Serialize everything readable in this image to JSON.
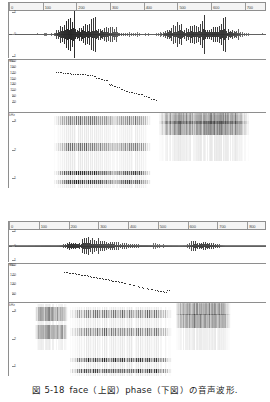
{
  "figure": {
    "caption_number": "図 5-18",
    "caption_text": "face（上図）phase（下図）の音声波形.",
    "caption_full": "図 5-18　face（上図）phase（下図）の音声波形.",
    "word_top": "face",
    "word_bottom": "phase"
  },
  "panels": [
    {
      "id": "top-panel",
      "word": "face",
      "position_label": "上図",
      "time_axis": {
        "unit": "ms",
        "ticks": [
          "0",
          "100",
          "200",
          "300",
          "400",
          "500",
          "600",
          "700"
        ],
        "min": 0,
        "max": 760
      },
      "waveform": {
        "ylabel": "",
        "ytick_labels": [
          "1",
          "0",
          "-1"
        ],
        "zero_line": true
      },
      "pitch": {
        "ylabel": "Hz",
        "unit_label": "Hz",
        "ytick_labels": [
          "200",
          "190",
          "170",
          "150",
          "130",
          "110",
          "90",
          "70"
        ],
        "ymin": 60,
        "ymax": 200
      },
      "spectrogram": {
        "ylabel": "kHz",
        "unit_label": "kHz",
        "ytick_labels": [
          "3",
          "2",
          "1"
        ],
        "ymin": 0,
        "ymax": 4
      }
    },
    {
      "id": "bottom-panel",
      "word": "phase",
      "position_label": "下図",
      "time_axis": {
        "unit": "ms",
        "ticks": [
          "0",
          "100",
          "200",
          "300",
          "400",
          "500",
          "600",
          "700",
          "800"
        ],
        "min": 0,
        "max": 860
      },
      "waveform": {
        "ylabel": "",
        "ytick_labels": [
          "1",
          "0",
          "-1"
        ],
        "zero_line": true
      },
      "pitch": {
        "ylabel": "Hz",
        "unit_label": "Hz",
        "ytick_labels": [
          "200",
          "170",
          "130",
          "90"
        ],
        "ymin": 60,
        "ymax": 200
      },
      "spectrogram": {
        "ylabel": "kHz",
        "unit_label": "kHz",
        "ytick_labels": [
          "3",
          "2",
          "1"
        ],
        "ymin": 0,
        "ymax": 4
      }
    }
  ],
  "chart_data": {
    "type": "line",
    "xlabel": "time (ms)",
    "ylabel": "amplitude / F0 (Hz) / frequency (kHz)",
    "grid": false,
    "legend": "none",
    "subcharts": [
      {
        "name": "face-waveform",
        "type": "line",
        "xlim": [
          0,
          760
        ],
        "ylim": [
          -1,
          1
        ],
        "x_ticks": [
          0,
          100,
          200,
          300,
          400,
          500,
          600,
          700
        ],
        "y_ticks": [
          -1,
          0,
          1
        ],
        "envelope_x": [
          60,
          80,
          100,
          120,
          130,
          140,
          150,
          160,
          170,
          180,
          190,
          200,
          210,
          220,
          230,
          240,
          250,
          260,
          270,
          280,
          290,
          300,
          310,
          320,
          330,
          340,
          350,
          360,
          370,
          380,
          390,
          400,
          410,
          420,
          430,
          440,
          450,
          460,
          470,
          480,
          490,
          500,
          510,
          520,
          530,
          540,
          550,
          560,
          570,
          580,
          590,
          600,
          610,
          620,
          630,
          640,
          650,
          660,
          670,
          680,
          690,
          700,
          710
        ],
        "envelope_y": [
          0.02,
          0.03,
          0.04,
          0.06,
          0.1,
          0.55,
          0.72,
          0.8,
          0.85,
          0.88,
          0.84,
          0.8,
          0.82,
          0.78,
          0.8,
          0.76,
          0.72,
          0.7,
          0.66,
          0.6,
          0.55,
          0.48,
          0.4,
          0.33,
          0.26,
          0.2,
          0.16,
          0.13,
          0.1,
          0.08,
          0.06,
          0.05,
          0.04,
          0.03,
          0.03,
          0.05,
          0.2,
          0.45,
          0.55,
          0.6,
          0.58,
          0.62,
          0.66,
          0.6,
          0.64,
          0.7,
          0.66,
          0.62,
          0.68,
          0.72,
          0.66,
          0.7,
          0.74,
          0.68,
          0.72,
          0.66,
          0.6,
          0.52,
          0.42,
          0.3,
          0.18,
          0.08,
          0.03
        ]
      },
      {
        "name": "face-pitch",
        "type": "scatter",
        "xlim": [
          0,
          760
        ],
        "ylim": [
          60,
          200
        ],
        "y_ticks": [
          70,
          90,
          110,
          130,
          150,
          170,
          190,
          200
        ],
        "x": [
          140,
          150,
          160,
          170,
          180,
          190,
          200,
          210,
          220,
          230,
          240,
          250,
          258,
          266,
          276,
          286,
          296,
          300,
          310,
          320,
          330,
          340,
          350,
          360,
          370,
          380,
          390,
          400,
          410,
          420,
          430
        ],
        "y": [
          168,
          167,
          166,
          166,
          165,
          164,
          164,
          163,
          162,
          161,
          160,
          158,
          152,
          150,
          148,
          147,
          136,
          134,
          130,
          128,
          122,
          118,
          116,
          114,
          112,
          110,
          108,
          104,
          100,
          96,
          94
        ]
      },
      {
        "name": "face-spectrogram",
        "type": "heatmap",
        "xlim": [
          0,
          760
        ],
        "ylim": [
          0,
          4
        ],
        "y_ticks": [
          1,
          2,
          3
        ],
        "regions": [
          {
            "label": "voiced /eI/",
            "x_start": 130,
            "x_end": 420,
            "dominant_bands_khz": [
              0.3,
              0.8,
              2.2,
              3.6
            ]
          },
          {
            "label": "fricative /s/",
            "x_start": 440,
            "x_end": 710,
            "dominant_bands_khz": [
              3.2,
              3.8
            ]
          }
        ]
      },
      {
        "name": "phase-waveform",
        "type": "line",
        "xlim": [
          0,
          860
        ],
        "ylim": [
          -1,
          1
        ],
        "x_ticks": [
          0,
          100,
          200,
          300,
          400,
          500,
          600,
          700,
          800
        ],
        "y_ticks": [
          -1,
          0,
          1
        ],
        "envelope_x": [
          60,
          80,
          100,
          110,
          120,
          130,
          140,
          150,
          160,
          170,
          180,
          190,
          200,
          210,
          220,
          230,
          240,
          250,
          260,
          270,
          280,
          290,
          300,
          310,
          320,
          330,
          340,
          350,
          360,
          370,
          380,
          390,
          400,
          410,
          420,
          430,
          440,
          450,
          460,
          470,
          480,
          490,
          500,
          510,
          520,
          530,
          540,
          550,
          560,
          570,
          580,
          590,
          600,
          610,
          620,
          630,
          640,
          650,
          660,
          670,
          680,
          690,
          700,
          710,
          720
        ],
        "envelope_y": [
          0.03,
          0.05,
          0.07,
          0.09,
          0.1,
          0.12,
          0.1,
          0.08,
          0.1,
          0.14,
          0.3,
          0.58,
          0.72,
          0.74,
          0.7,
          0.68,
          0.66,
          0.64,
          0.62,
          0.6,
          0.58,
          0.56,
          0.54,
          0.52,
          0.5,
          0.48,
          0.46,
          0.44,
          0.42,
          0.4,
          0.38,
          0.36,
          0.34,
          0.32,
          0.3,
          0.28,
          0.26,
          0.25,
          0.24,
          0.22,
          0.2,
          0.18,
          0.16,
          0.14,
          0.12,
          0.1,
          0.08,
          0.07,
          0.06,
          0.05,
          0.05,
          0.1,
          0.3,
          0.52,
          0.58,
          0.56,
          0.6,
          0.54,
          0.58,
          0.56,
          0.52,
          0.44,
          0.32,
          0.16,
          0.05
        ]
      },
      {
        "name": "phase-pitch",
        "type": "scatter",
        "xlim": [
          0,
          860
        ],
        "ylim": [
          60,
          200
        ],
        "y_ticks": [
          90,
          130,
          170,
          200
        ],
        "x": [
          185,
          195,
          205,
          215,
          225,
          235,
          245,
          255,
          265,
          275,
          285,
          295,
          305,
          315,
          325,
          335,
          345,
          355,
          365,
          375,
          385,
          400,
          415,
          430,
          445,
          460,
          475,
          490,
          500,
          510,
          520,
          530
        ],
        "y": [
          172,
          170,
          168,
          166,
          164,
          162,
          160,
          158,
          156,
          154,
          152,
          150,
          148,
          146,
          144,
          142,
          140,
          138,
          136,
          134,
          130,
          126,
          122,
          118,
          114,
          110,
          108,
          104,
          102,
          100,
          98,
          104
        ]
      },
      {
        "name": "phase-spectrogram",
        "type": "heatmap",
        "xlim": [
          0,
          860
        ],
        "ylim": [
          0,
          4
        ],
        "y_ticks": [
          1,
          2,
          3
        ],
        "regions": [
          {
            "label": "fricative /f/",
            "x_start": 85,
            "x_end": 195,
            "dominant_bands_khz": [
              2.4,
              3.4
            ]
          },
          {
            "label": "voiced /eI/",
            "x_start": 200,
            "x_end": 545,
            "dominant_bands_khz": [
              0.3,
              0.9,
              2.4,
              3.4
            ]
          },
          {
            "label": "fricative /z/",
            "x_start": 555,
            "x_end": 740,
            "dominant_bands_khz": [
              3.0,
              3.7
            ]
          }
        ]
      }
    ]
  }
}
